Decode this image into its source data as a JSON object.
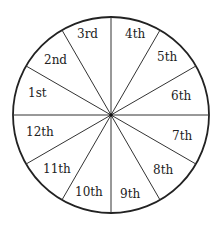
{
  "diagram": {
    "type": "house-wheel",
    "center": [
      111,
      115
    ],
    "radius": 98,
    "stroke_color": "#222222",
    "background": "#ffffff",
    "spoke_angles_deg": [
      0,
      30,
      60,
      90,
      120,
      150,
      180,
      210,
      240,
      270,
      300,
      330
    ],
    "houses": [
      {
        "label": "1st",
        "x": 28,
        "y": 97
      },
      {
        "label": "2nd",
        "x": 44,
        "y": 64
      },
      {
        "label": "3rd",
        "x": 77,
        "y": 38
      },
      {
        "label": "4th",
        "x": 125,
        "y": 38
      },
      {
        "label": "5th",
        "x": 157,
        "y": 61
      },
      {
        "label": "6th",
        "x": 171,
        "y": 100
      },
      {
        "label": "7th",
        "x": 172,
        "y": 140
      },
      {
        "label": "8th",
        "x": 153,
        "y": 174
      },
      {
        "label": "9th",
        "x": 120,
        "y": 198
      },
      {
        "label": "10th",
        "x": 75,
        "y": 196
      },
      {
        "label": "11th",
        "x": 43,
        "y": 173
      },
      {
        "label": "12th",
        "x": 26,
        "y": 136
      }
    ]
  }
}
